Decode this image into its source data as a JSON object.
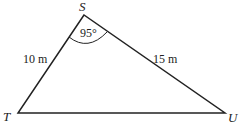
{
  "diagram": {
    "type": "triangle",
    "vertices": {
      "S": {
        "label": "S",
        "x": 84,
        "y": 15
      },
      "T": {
        "label": "T",
        "x": 18,
        "y": 113
      },
      "U": {
        "label": "U",
        "x": 225,
        "y": 113
      }
    },
    "sides": {
      "ST": {
        "label": "10 m"
      },
      "SU": {
        "label": "15 m"
      }
    },
    "angle_S": {
      "label": "95°"
    },
    "colors": {
      "stroke": "#222222",
      "background": "#ffffff"
    }
  }
}
